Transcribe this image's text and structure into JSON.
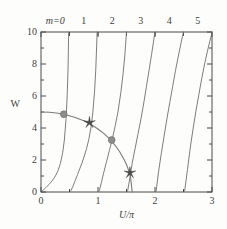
{
  "chart_data": {
    "type": "line",
    "title": "",
    "xlabel": "U/π",
    "ylabel": "W",
    "xlim": [
      0,
      3
    ],
    "ylim": [
      0,
      10
    ],
    "xticks": [
      0,
      1,
      2,
      3
    ],
    "xticklabels": [
      "0",
      "1",
      "2",
      "3"
    ],
    "yticks": [
      0,
      2,
      4,
      6,
      8,
      10
    ],
    "yticklabels": [
      "0",
      "2",
      "4",
      "6",
      "8",
      "10"
    ],
    "x_minor_ticks": [
      0.5,
      1.5,
      2.5
    ],
    "top_axis_labels": [
      "m=0",
      "1",
      "2",
      "3",
      "4",
      "5"
    ],
    "top_axis_label_positions": [
      0.25,
      0.75,
      1.25,
      1.75,
      2.25,
      2.75
    ],
    "grid": false,
    "legend": null,
    "series": [
      {
        "name": "branch m=0",
        "comment": "W = (U/π)*π*tan-branch, rises from (0,0) to asymptote at U/π=0.5",
        "x": [
          0.02,
          0.06,
          0.1,
          0.14,
          0.18,
          0.22,
          0.26,
          0.3,
          0.34,
          0.38,
          0.41,
          0.44,
          0.46,
          0.475,
          0.485
        ],
        "y": [
          0.06,
          0.19,
          0.33,
          0.47,
          0.63,
          0.82,
          1.05,
          1.35,
          1.78,
          2.45,
          3.25,
          4.6,
          6.1,
          7.8,
          10.0
        ]
      },
      {
        "name": "branch m=1",
        "x": [
          0.52,
          0.56,
          0.6,
          0.64,
          0.68,
          0.72,
          0.76,
          0.8,
          0.84,
          0.88,
          0.91,
          0.94,
          0.96,
          0.975,
          0.985
        ],
        "y": [
          0.05,
          0.35,
          0.72,
          1.08,
          1.45,
          1.82,
          2.25,
          2.72,
          3.3,
          4.1,
          5.0,
          6.3,
          7.6,
          9.0,
          10.0
        ]
      },
      {
        "name": "branch m=2",
        "x": [
          1.02,
          1.06,
          1.1,
          1.15,
          1.2,
          1.25,
          1.3,
          1.35,
          1.4,
          1.44,
          1.47,
          1.49,
          1.5
        ],
        "y": [
          0.05,
          0.6,
          1.2,
          1.9,
          2.6,
          3.3,
          4.1,
          5.0,
          6.2,
          7.4,
          8.5,
          9.5,
          10.0
        ]
      },
      {
        "name": "branch m=3",
        "x": [
          1.52,
          1.56,
          1.6,
          1.65,
          1.7,
          1.75,
          1.8,
          1.85,
          1.9,
          1.94,
          1.97,
          1.99,
          2.0
        ],
        "y": [
          0.05,
          0.9,
          1.8,
          2.7,
          3.6,
          4.5,
          5.5,
          6.6,
          7.7,
          8.6,
          9.3,
          9.8,
          10.0
        ]
      },
      {
        "name": "branch m=4",
        "x": [
          2.02,
          2.06,
          2.11,
          2.16,
          2.21,
          2.26,
          2.31,
          2.36,
          2.41,
          2.45,
          2.48,
          2.5
        ],
        "y": [
          0.05,
          1.2,
          2.4,
          3.5,
          4.6,
          5.6,
          6.6,
          7.6,
          8.5,
          9.2,
          9.7,
          10.0
        ]
      },
      {
        "name": "branch m=5",
        "x": [
          2.52,
          2.57,
          2.62,
          2.67,
          2.72,
          2.77,
          2.82,
          2.87,
          2.92,
          2.96,
          2.99,
          3.0
        ],
        "y": [
          0.05,
          1.4,
          2.8,
          4.0,
          5.1,
          6.1,
          7.1,
          8.0,
          8.8,
          9.4,
          9.8,
          10.0
        ]
      },
      {
        "name": "constraint arc",
        "comment": "descending quarter-circle from (0,5) to (1.6,0)",
        "x": [
          0.0,
          0.15,
          0.3,
          0.45,
          0.6,
          0.75,
          0.9,
          1.0,
          1.1,
          1.2,
          1.3,
          1.38,
          1.45,
          1.5,
          1.54,
          1.57,
          1.6
        ],
        "y": [
          5.0,
          4.98,
          4.92,
          4.81,
          4.66,
          4.45,
          4.17,
          3.94,
          3.66,
          3.34,
          2.92,
          2.52,
          2.08,
          1.72,
          1.32,
          0.95,
          0.0
        ]
      }
    ],
    "markers": [
      {
        "kind": "circle",
        "x": 0.4,
        "y": 4.86,
        "label": "intersection m=0"
      },
      {
        "kind": "star",
        "x": 0.85,
        "y": 4.34,
        "label": "intersection m=1"
      },
      {
        "kind": "circle",
        "x": 1.24,
        "y": 3.25,
        "label": "intersection m=2"
      },
      {
        "kind": "star",
        "x": 1.56,
        "y": 1.2,
        "label": "intersection m=3"
      }
    ],
    "colors": {
      "branch": "#6e6e6e",
      "arc": "#7a7a7a",
      "circle_marker": "#8c8c8c",
      "star_marker": "#4a4a4a",
      "axis": "#4a4a4a",
      "background": "#fdfdfc"
    }
  },
  "axes": {
    "y_label": "W",
    "x_label": "U/π",
    "x_tick_labels": [
      "0",
      "1",
      "2",
      "3"
    ],
    "y_tick_labels": [
      "0",
      "2",
      "4",
      "6",
      "8",
      "10"
    ]
  },
  "top_labels": {
    "m0": "m=0",
    "m1": "1",
    "m2": "2",
    "m3": "3",
    "m4": "4",
    "m5": "5"
  }
}
